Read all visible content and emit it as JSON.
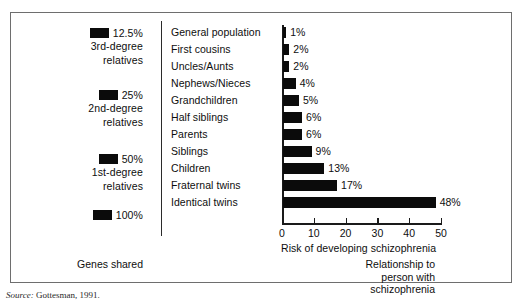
{
  "figure": {
    "top_crop_sliver": "",
    "source_label": "Source:",
    "source_text": "Gottesman, 1991."
  },
  "legend": {
    "caption": "Genes shared",
    "groups": [
      {
        "percent": "12.5%",
        "sub_line1": "3rd-degree",
        "sub_line2": "relatives"
      },
      {
        "percent": "25%",
        "sub_line1": "2nd-degree",
        "sub_line2": "relatives"
      },
      {
        "percent": "50%",
        "sub_line1": "1st-degree",
        "sub_line2": "relatives"
      },
      {
        "percent": "100%",
        "sub_line1": "",
        "sub_line2": ""
      }
    ],
    "swatch_color": "#0b0b0b"
  },
  "relationship": {
    "caption_line1": "Relationship to",
    "caption_line2": "person with",
    "caption_line3": "schizophrenia"
  },
  "chart_data": {
    "type": "bar",
    "orientation": "horizontal",
    "title": "",
    "subtitle": "",
    "xlabel": "Risk of developing schizophrenia",
    "ylabel": "",
    "xlim": [
      0,
      50
    ],
    "xticks": [
      0,
      10,
      20,
      30,
      40,
      50
    ],
    "xtick_labels": [
      "0",
      "10",
      "20",
      "30",
      "40",
      "50"
    ],
    "grid": false,
    "legend_position": "left",
    "bar_color": "#0b0b0b",
    "categories": [
      "General population",
      "First cousins",
      "Uncles/Aunts",
      "Nephews/Nieces",
      "Grandchildren",
      "Half siblings",
      "Parents",
      "Siblings",
      "Children",
      "Fraternal twins",
      "Identical twins"
    ],
    "values": [
      1,
      2,
      2,
      4,
      5,
      6,
      6,
      9,
      13,
      17,
      48
    ],
    "data_labels": [
      "1%",
      "2%",
      "2%",
      "4%",
      "5%",
      "6%",
      "6%",
      "9%",
      "13%",
      "17%",
      "48%"
    ],
    "genes_shared_group": [
      "3rd-degree relatives",
      "3rd-degree relatives",
      "2nd-degree relatives",
      "2nd-degree relatives",
      "2nd-degree relatives",
      "2nd-degree relatives",
      "1st-degree relatives",
      "1st-degree relatives",
      "1st-degree relatives",
      "1st-degree relatives",
      "100%"
    ]
  }
}
